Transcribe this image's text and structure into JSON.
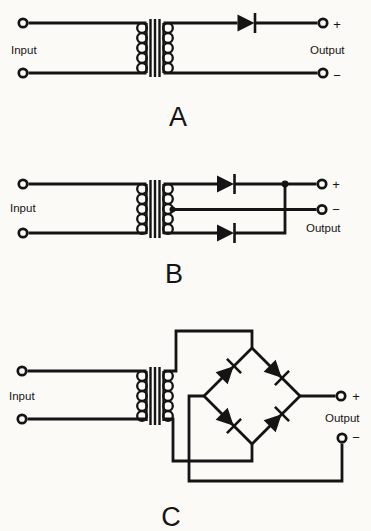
{
  "figure": {
    "background_color": "#fbfaf7",
    "ink_color": "#141414",
    "diagrams": [
      {
        "label": "A",
        "input_label": "Input",
        "output_label": "Output",
        "plus_sign": "+",
        "minus_sign": "−"
      },
      {
        "label": "B",
        "input_label": "Input",
        "output_label": "Output",
        "plus_sign": "+",
        "minus_sign": "−"
      },
      {
        "label": "C",
        "input_label": "Input",
        "output_label": "Output",
        "plus_sign": "+",
        "minus_sign": "−"
      }
    ]
  }
}
